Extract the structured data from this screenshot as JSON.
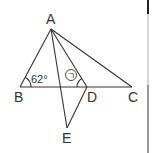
{
  "figure": {
    "type": "geometry",
    "points": {
      "A": {
        "label": "A",
        "x": 51,
        "y": 29
      },
      "B": {
        "label": "B",
        "x": 20,
        "y": 87
      },
      "D": {
        "label": "D",
        "x": 87,
        "y": 87
      },
      "C": {
        "label": "C",
        "x": 132,
        "y": 87
      },
      "E": {
        "label": "E",
        "x": 67,
        "y": 128
      }
    },
    "segments": [
      "AB",
      "AC",
      "AD",
      "AE",
      "BC",
      "DE"
    ],
    "angles": [
      {
        "vertex": "B",
        "label": "62°"
      },
      {
        "vertex": "D",
        "label": "ㄱ",
        "circled": true
      }
    ],
    "line_color": "#333333"
  }
}
